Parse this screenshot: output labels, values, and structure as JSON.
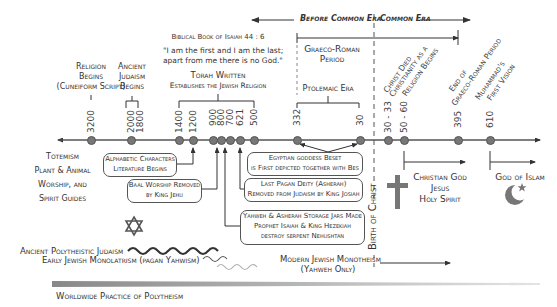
{
  "eras": {
    "bce": "Before Common Era",
    "ce": "Common Era",
    "graeco_roman": "Graeco-Roman Period",
    "ptolemaic": "Ptolemaic Era",
    "birth_of_christ": "Birth of Christ"
  },
  "top_labels": {
    "religion_begins": [
      "Religion",
      "Begins",
      "(Cuneiform Script)"
    ],
    "ancient_judaism": [
      "Ancient",
      "Judaism",
      "Begins"
    ],
    "isaiah_ref": "Biblical Book of Isaiah 44 : 6",
    "isaiah_quote_1": "\"I am the first and I am the last;",
    "isaiah_quote_2": "apart from me there is no God.\"",
    "torah_1": "Torah Written",
    "torah_2": "Establishes the Jewish Religion"
  },
  "diagonal_labels": {
    "christ_died": "Christ Died",
    "christianity_1": "Christianity as a",
    "christianity_2": "Religion Begins",
    "end_gr_1": "End of",
    "end_gr_2": "Graeco-Roman Period",
    "muhammad_1": "Muhammad's",
    "muhammad_2": "First Vision"
  },
  "ticks": [
    "3200",
    "2000",
    "1800",
    "1400",
    "1200",
    "900",
    "800",
    "700",
    "621",
    "500",
    "332",
    "30",
    "30 - 33",
    "50 - 60",
    "395",
    "610"
  ],
  "left_text": [
    "Totemism",
    "Plant & Animal",
    "Worship, and",
    "Spirit Guides"
  ],
  "boxes": {
    "alphabet": [
      "Alphabetic Characters",
      "Literature Begins"
    ],
    "baal": [
      "Baal Worship Removed",
      "by King Jehu"
    ],
    "egypt": [
      "Egyptian goddess Beset",
      "is First depicted together with Bes"
    ],
    "asherah": [
      "Last Pagan Deity (Asherah)",
      "Removed from Judaism by King Josiah"
    ],
    "jars": [
      "Yahweh & Asherah Storage Jars Made",
      "Prophet Isaiah & King Hezekiah",
      "destroy serpent Nehushtan"
    ]
  },
  "right_text": {
    "christian": [
      "Christian God",
      "Jesus",
      "Holy Spirit"
    ],
    "islam": "God of Islam"
  },
  "bottom": {
    "ancient_poly": "Ancient Polytheistic Judaism",
    "early_mono": "Early Jewish Monolatrism (pagan Yahwism)",
    "modern_1": "Modern Jewish Monotheism",
    "modern_2": "(Yahweh Only)",
    "worldwide": "Worldwide Practice of Polytheism"
  },
  "colors": {
    "line": "#555555",
    "dot": "#777777",
    "gradient_dark": "#888888",
    "gradient_light": "#dddddd"
  }
}
